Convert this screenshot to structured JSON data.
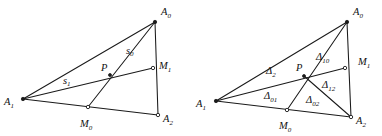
{
  "figure": {
    "background_color": "#ffffff",
    "stroke_color": "#1a1a1a",
    "text_color": "#111111",
    "panels": [
      {
        "id": "left-panel",
        "name": "cevian-triangle-with-medial-segments",
        "points": {
          "A0": {
            "label": "A",
            "sub": "0",
            "x": 155,
            "y": 22
          },
          "A1": {
            "label": "A",
            "sub": "1",
            "x": 23,
            "y": 99
          },
          "A2": {
            "label": "A",
            "sub": "2",
            "x": 158,
            "y": 115
          },
          "M0": {
            "label": "M",
            "sub": "0",
            "x": 88,
            "y": 107
          },
          "M1": {
            "label": "M",
            "sub": "1",
            "x": 153,
            "y": 68
          },
          "P": {
            "label": "P",
            "sub": "",
            "x": 110,
            "y": 75
          }
        },
        "segment_labels": [
          {
            "name": "s0",
            "label": "s",
            "sub": "0",
            "x": 128,
            "y": 52
          },
          {
            "name": "s1",
            "label": "s",
            "sub": "1",
            "x": 66,
            "y": 82
          }
        ],
        "point_labels": [
          {
            "name": "A0",
            "text": "A",
            "sub": "0",
            "x": 161,
            "y": 14
          },
          {
            "name": "A1",
            "text": "A",
            "sub": "1",
            "x": 5,
            "y": 104
          },
          {
            "name": "A2",
            "text": "A",
            "sub": "2",
            "x": 163,
            "y": 122
          },
          {
            "name": "M0",
            "text": "M",
            "sub": "0",
            "x": 80,
            "y": 126
          },
          {
            "name": "M1",
            "text": "M",
            "sub": "1",
            "x": 159,
            "y": 68
          },
          {
            "name": "P",
            "text": "P",
            "sub": "",
            "x": 102,
            "y": 70
          }
        ]
      },
      {
        "id": "right-panel",
        "name": "triangle-partitioned-into-sub-triangles",
        "points": {
          "A0": {
            "label": "A",
            "sub": "0",
            "x": 347,
            "y": 22
          },
          "A1": {
            "label": "A",
            "sub": "1",
            "x": 216,
            "y": 101
          },
          "A2": {
            "label": "A",
            "sub": "2",
            "x": 351,
            "y": 117
          },
          "M0": {
            "label": "M",
            "sub": "0",
            "x": 287,
            "y": 110
          },
          "M1": {
            "label": "M",
            "sub": "1",
            "x": 345,
            "y": 68
          },
          "P": {
            "label": "P",
            "sub": "",
            "x": 304,
            "y": 76
          }
        },
        "region_labels": [
          {
            "name": "delta-10",
            "text": "Δ",
            "sub": "10",
            "x": 322,
            "y": 58
          },
          {
            "name": "delta-2",
            "text": "Δ",
            "sub": "2",
            "x": 271,
            "y": 72
          },
          {
            "name": "delta-12",
            "text": "Δ",
            "sub": "12",
            "x": 328,
            "y": 86
          },
          {
            "name": "delta-01",
            "text": "Δ",
            "sub": "01",
            "x": 270,
            "y": 97
          },
          {
            "name": "delta-02",
            "text": "Δ",
            "sub": "02",
            "x": 312,
            "y": 101
          }
        ],
        "point_labels": [
          {
            "name": "A0",
            "text": "A",
            "sub": "0",
            "x": 353,
            "y": 14
          },
          {
            "name": "A1",
            "text": "A",
            "sub": "1",
            "x": 197,
            "y": 107
          },
          {
            "name": "A2",
            "text": "A",
            "sub": "2",
            "x": 356,
            "y": 124
          },
          {
            "name": "M0",
            "text": "M",
            "sub": "0",
            "x": 280,
            "y": 128
          },
          {
            "name": "M1",
            "text": "M",
            "sub": "1",
            "x": 358,
            "y": 64
          },
          {
            "name": "P",
            "text": "P",
            "sub": "",
            "x": 297,
            "y": 70
          }
        ]
      }
    ]
  }
}
